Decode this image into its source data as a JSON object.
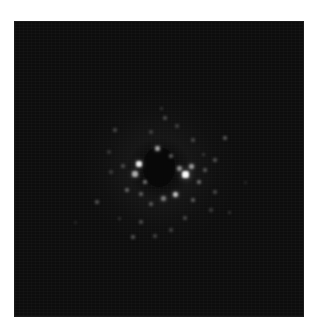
{
  "image": {
    "kind": "grayscale diffraction-like pattern",
    "background_color": "#0d0d0d",
    "page_background": "#ffffff",
    "frame": {
      "x": 15,
      "y": 22,
      "width": 288,
      "height": 294
    }
  },
  "spots": [
    {
      "x": 124,
      "y": 142,
      "size": 6,
      "brightness": 235
    },
    {
      "x": 120,
      "y": 152,
      "size": 6,
      "brightness": 170
    },
    {
      "x": 170,
      "y": 152,
      "size": 7,
      "brightness": 250
    },
    {
      "x": 176,
      "y": 144,
      "size": 5,
      "brightness": 150
    },
    {
      "x": 160,
      "y": 172,
      "size": 5,
      "brightness": 190
    },
    {
      "x": 142,
      "y": 126,
      "size": 5,
      "brightness": 160
    },
    {
      "x": 148,
      "y": 176,
      "size": 5,
      "brightness": 120
    },
    {
      "x": 164,
      "y": 146,
      "size": 5,
      "brightness": 140
    },
    {
      "x": 184,
      "y": 160,
      "size": 4,
      "brightness": 110
    },
    {
      "x": 112,
      "y": 168,
      "size": 4,
      "brightness": 100
    },
    {
      "x": 126,
      "y": 172,
      "size": 4,
      "brightness": 95
    },
    {
      "x": 136,
      "y": 182,
      "size": 4,
      "brightness": 90
    },
    {
      "x": 178,
      "y": 178,
      "size": 4,
      "brightness": 90
    },
    {
      "x": 190,
      "y": 148,
      "size": 4,
      "brightness": 85
    },
    {
      "x": 200,
      "y": 138,
      "size": 4,
      "brightness": 80
    },
    {
      "x": 210,
      "y": 116,
      "size": 4,
      "brightness": 85
    },
    {
      "x": 82,
      "y": 180,
      "size": 4,
      "brightness": 80
    },
    {
      "x": 100,
      "y": 108,
      "size": 4,
      "brightness": 70
    },
    {
      "x": 150,
      "y": 96,
      "size": 4,
      "brightness": 75
    },
    {
      "x": 162,
      "y": 104,
      "size": 4,
      "brightness": 65
    },
    {
      "x": 178,
      "y": 118,
      "size": 4,
      "brightness": 70
    },
    {
      "x": 136,
      "y": 110,
      "size": 4,
      "brightness": 65
    },
    {
      "x": 170,
      "y": 196,
      "size": 4,
      "brightness": 70
    },
    {
      "x": 126,
      "y": 200,
      "size": 4,
      "brightness": 75
    },
    {
      "x": 156,
      "y": 208,
      "size": 4,
      "brightness": 65
    },
    {
      "x": 140,
      "y": 214,
      "size": 4,
      "brightness": 65
    },
    {
      "x": 118,
      "y": 215,
      "size": 4,
      "brightness": 80
    },
    {
      "x": 108,
      "y": 144,
      "size": 4,
      "brightness": 75
    },
    {
      "x": 200,
      "y": 170,
      "size": 4,
      "brightness": 70
    },
    {
      "x": 196,
      "y": 188,
      "size": 4,
      "brightness": 60
    },
    {
      "x": 96,
      "y": 150,
      "size": 4,
      "brightness": 60
    },
    {
      "x": 94,
      "y": 130,
      "size": 4,
      "brightness": 55
    },
    {
      "x": 156,
      "y": 134,
      "size": 4,
      "brightness": 90
    },
    {
      "x": 130,
      "y": 160,
      "size": 4,
      "brightness": 110
    },
    {
      "x": 188,
      "y": 132,
      "size": 3,
      "brightness": 60
    },
    {
      "x": 146,
      "y": 86,
      "size": 3,
      "brightness": 55
    },
    {
      "x": 214,
      "y": 190,
      "size": 3,
      "brightness": 55
    },
    {
      "x": 104,
      "y": 196,
      "size": 3,
      "brightness": 55
    },
    {
      "x": 60,
      "y": 200,
      "size": 3,
      "brightness": 40
    },
    {
      "x": 230,
      "y": 160,
      "size": 3,
      "brightness": 40
    }
  ]
}
